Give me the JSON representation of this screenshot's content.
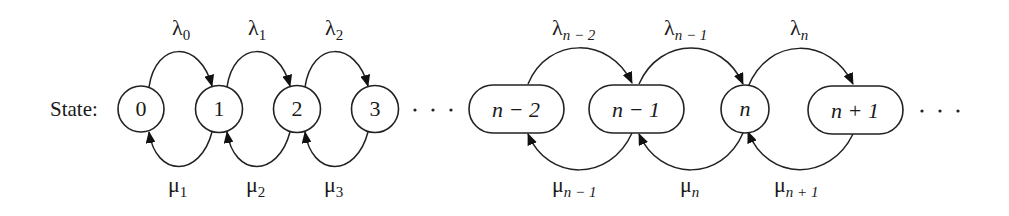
{
  "diagram": {
    "type": "birth-death-process-state-diagram",
    "prefix_label": "State:",
    "states": [
      {
        "id": "s0",
        "label": "0",
        "shape": "circle",
        "cx": 141,
        "w": 46
      },
      {
        "id": "s1",
        "label": "1",
        "shape": "circle",
        "cx": 219,
        "w": 47
      },
      {
        "id": "s2",
        "label": "2",
        "shape": "circle",
        "cx": 297,
        "w": 47
      },
      {
        "id": "s3",
        "label": "3",
        "shape": "circle",
        "cx": 375,
        "w": 47
      },
      {
        "id": "sn-2",
        "label": "n − 2",
        "shape": "pill",
        "cx": 516,
        "w": 95
      },
      {
        "id": "sn-1",
        "label": "n − 1",
        "shape": "pill",
        "cx": 636,
        "w": 95
      },
      {
        "id": "sn",
        "label": "n",
        "shape": "circle",
        "cx": 745,
        "w": 48
      },
      {
        "id": "sn+1",
        "label": "n + 1",
        "shape": "pill",
        "cx": 855,
        "w": 95
      }
    ],
    "ellipsis_middle": "· · ·",
    "ellipsis_end": "· · ·",
    "birth_rates": [
      {
        "symbol": "λ",
        "sub": "0",
        "from": "0",
        "to": "1"
      },
      {
        "symbol": "λ",
        "sub": "1",
        "from": "1",
        "to": "2"
      },
      {
        "symbol": "λ",
        "sub": "2",
        "from": "2",
        "to": "3"
      },
      {
        "symbol": "λ",
        "sub": "n − 2",
        "from": "n − 2",
        "to": "n − 1"
      },
      {
        "symbol": "λ",
        "sub": "n − 1",
        "from": "n − 1",
        "to": "n"
      },
      {
        "symbol": "λ",
        "sub": "n",
        "from": "n",
        "to": "n + 1"
      }
    ],
    "death_rates": [
      {
        "symbol": "μ",
        "sub": "1",
        "from": "1",
        "to": "0"
      },
      {
        "symbol": "μ",
        "sub": "2",
        "from": "2",
        "to": "1"
      },
      {
        "symbol": "μ",
        "sub": "3",
        "from": "3",
        "to": "2"
      },
      {
        "symbol": "μ",
        "sub": "n − 1",
        "from": "n − 1",
        "to": "n − 2"
      },
      {
        "symbol": "μ",
        "sub": "n",
        "from": "n",
        "to": "n − 1"
      },
      {
        "symbol": "μ",
        "sub": "n + 1",
        "from": "n + 1",
        "to": "n"
      }
    ]
  }
}
